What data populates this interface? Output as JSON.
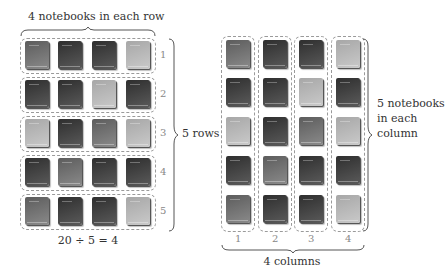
{
  "left_diagram": {
    "top_label": "4 notebooks in each row",
    "side_label": "5 rows",
    "equation": "20 ÷ 5 = 4",
    "row_numbers": [
      "1",
      "2",
      "3",
      "4",
      "5"
    ],
    "rows": [
      [
        "medium",
        "dark",
        "dark",
        "light"
      ],
      [
        "dark",
        "dark",
        "light",
        "dark"
      ],
      [
        "light",
        "dark",
        "medium",
        "light"
      ],
      [
        "dark",
        "medium",
        "dark",
        "dark"
      ],
      [
        "medium",
        "dark",
        "dark",
        "light"
      ]
    ]
  },
  "right_diagram": {
    "side_label_lines": [
      "5 notebooks",
      "in each",
      "column"
    ],
    "bottom_label": "4 columns",
    "column_numbers": [
      "1",
      "2",
      "3",
      "4"
    ],
    "rows": [
      [
        "medium",
        "dark",
        "dark",
        "light"
      ],
      [
        "dark",
        "dark",
        "light",
        "dark"
      ],
      [
        "light",
        "dark",
        "medium",
        "light"
      ],
      [
        "dark",
        "medium",
        "dark",
        "dark"
      ],
      [
        "medium",
        "dark",
        "dark",
        "light"
      ]
    ]
  },
  "colors": {
    "dark": [
      "#5a5a5a",
      "#2e2e2e"
    ],
    "medium": [
      "#8a8a8a",
      "#5c5c5c"
    ],
    "light": [
      "#c9c9c9",
      "#a7a7a7"
    ],
    "dashed_border": "#9a9a9a",
    "brace": "#555555"
  }
}
